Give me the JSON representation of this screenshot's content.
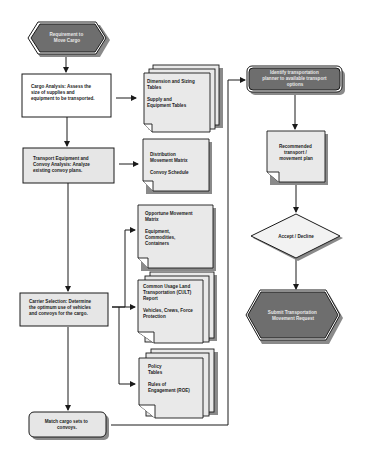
{
  "diagram": {
    "nodes": {
      "start": {
        "lines": [
          "Requirement to",
          "Move Cargo"
        ],
        "shape": "hexagon"
      },
      "cargo_analysis": {
        "lines": [
          "Cargo Analysis: Assess the",
          "size of supplies and",
          "equipment to be transported."
        ],
        "shape": "process"
      },
      "dimension_tables": {
        "lines": [
          "Dimension and Sizing",
          "Tables",
          "",
          "Supply and",
          "Equipment Tables"
        ],
        "shape": "multi-document"
      },
      "transport_equipment": {
        "lines": [
          "Transport Equipment and",
          "Convoy Analysis: Analyze",
          "existing convoy plans."
        ],
        "shape": "process"
      },
      "distribution_matrix": {
        "lines": [
          "Distribution",
          "Movement Matrix",
          "",
          "Convoy Schedule"
        ],
        "shape": "document"
      },
      "opportune_matrix": {
        "lines": [
          "Opportune Movement",
          "Matrix",
          "",
          "Equipment,",
          "Commodities,",
          "Containers"
        ],
        "shape": "document"
      },
      "carrier_selection": {
        "lines": [
          "Carrier Selection: Determine",
          "the optimum use of vehicles",
          "and convoys for the cargo."
        ],
        "shape": "process"
      },
      "cult_report": {
        "lines": [
          "Common Usage Land",
          "Transportation (CULT)",
          "Report",
          "",
          "Vehicles, Crews, Force",
          "Protection"
        ],
        "shape": "multi-document"
      },
      "policy_tables": {
        "lines": [
          "Policy",
          "Tables",
          "",
          "Rules of",
          "Engagement (ROE)"
        ],
        "shape": "multi-document"
      },
      "match_cargo": {
        "lines": [
          "Match cargo sets to",
          "convoys."
        ],
        "shape": "rounded"
      },
      "identify_planner": {
        "lines": [
          "Identify transportation",
          "planner to available transport",
          "options"
        ],
        "shape": "rounded-dark"
      },
      "recommended_plan": {
        "lines": [
          "Recommended",
          "transport /",
          "movement plan"
        ],
        "shape": "document"
      },
      "accept_decline": {
        "lines": [
          "Accept / Decline"
        ],
        "shape": "decision"
      },
      "submit_request": {
        "lines": [
          "Submit Transportation",
          "Movement Request"
        ],
        "shape": "hexagon"
      }
    },
    "edges": [
      [
        "start",
        "cargo_analysis"
      ],
      [
        "cargo_analysis",
        "dimension_tables"
      ],
      [
        "cargo_analysis",
        "transport_equipment"
      ],
      [
        "transport_equipment",
        "distribution_matrix"
      ],
      [
        "transport_equipment",
        "carrier_selection"
      ],
      [
        "carrier_selection",
        "opportune_matrix"
      ],
      [
        "carrier_selection",
        "cult_report"
      ],
      [
        "carrier_selection",
        "policy_tables"
      ],
      [
        "carrier_selection",
        "match_cargo"
      ],
      [
        "match_cargo",
        "identify_planner"
      ],
      [
        "identify_planner",
        "recommended_plan"
      ],
      [
        "recommended_plan",
        "accept_decline"
      ],
      [
        "accept_decline",
        "submit_request"
      ]
    ]
  }
}
